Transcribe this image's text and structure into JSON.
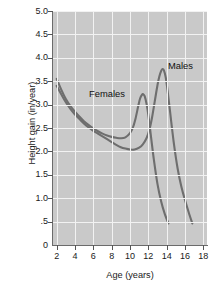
{
  "chart_data": {
    "type": "line",
    "title": "",
    "xlabel": "Age (years)",
    "ylabel": "Height gain (in/year)",
    "xlim": [
      1.6,
      18.4
    ],
    "ylim": [
      0,
      5.0
    ],
    "grid": true,
    "legend_position": "inline-annotation",
    "xticks": [
      "2",
      "4",
      "6",
      "8",
      "10",
      "12",
      "14",
      "16",
      "18"
    ],
    "xtick_values": [
      2,
      4,
      6,
      8,
      10,
      12,
      14,
      16,
      18
    ],
    "yticks": [
      "0",
      ".5",
      "1.0",
      "1.5",
      "2.0",
      "2.5",
      "3.0",
      "3.5",
      "4.0",
      "4.5",
      "5.0"
    ],
    "ytick_values": [
      0,
      0.5,
      1.0,
      1.5,
      2.0,
      2.5,
      3.0,
      3.5,
      4.0,
      4.5,
      5.0
    ],
    "series": [
      {
        "name": "Females",
        "color": "#6e6e6e",
        "x": [
          2.0,
          2.5,
          3.0,
          3.5,
          4.0,
          4.5,
          5.0,
          5.5,
          6.0,
          6.5,
          7.0,
          7.5,
          8.0,
          8.5,
          9.0,
          9.5,
          10.0,
          10.3,
          10.6,
          10.9,
          11.1,
          11.3,
          11.45,
          11.6,
          11.8,
          12.0,
          12.3,
          12.6,
          13.0,
          13.4,
          13.8,
          14.2
        ],
        "values": [
          3.55,
          3.32,
          3.12,
          2.97,
          2.85,
          2.74,
          2.64,
          2.56,
          2.49,
          2.43,
          2.38,
          2.34,
          2.31,
          2.29,
          2.28,
          2.3,
          2.39,
          2.5,
          2.7,
          2.97,
          3.13,
          3.21,
          3.22,
          3.18,
          3.02,
          2.78,
          2.3,
          1.83,
          1.3,
          0.93,
          0.66,
          0.46
        ]
      },
      {
        "name": "Males",
        "color": "#6e6e6e",
        "x": [
          2.0,
          2.5,
          3.0,
          3.5,
          4.0,
          4.5,
          5.0,
          5.5,
          6.0,
          6.5,
          7.0,
          7.5,
          8.0,
          8.5,
          9.0,
          9.5,
          10.0,
          10.5,
          11.0,
          11.4,
          11.8,
          12.1,
          12.4,
          12.7,
          13.0,
          13.2,
          13.4,
          13.55,
          13.7,
          13.9,
          14.1,
          14.4,
          14.8,
          15.2,
          15.6,
          16.0,
          16.4,
          16.8
        ],
        "values": [
          3.4,
          3.22,
          3.05,
          2.91,
          2.79,
          2.69,
          2.59,
          2.51,
          2.44,
          2.38,
          2.32,
          2.26,
          2.2,
          2.14,
          2.09,
          2.06,
          2.04,
          2.04,
          2.08,
          2.15,
          2.28,
          2.45,
          2.72,
          3.07,
          3.42,
          3.6,
          3.72,
          3.76,
          3.73,
          3.58,
          3.3,
          2.8,
          2.15,
          1.63,
          1.25,
          0.96,
          0.7,
          0.46
        ]
      }
    ],
    "annotations": [
      {
        "text": "Females",
        "x": 9.3,
        "y": 3.34
      },
      {
        "text": "Males",
        "x": 15.6,
        "y": 3.93
      }
    ]
  },
  "style": {
    "plot_background": "#c9c9c9",
    "grid_color": "#f2f2f2",
    "axis_color": "#6b6b6b",
    "text_color": "#1a1a1a",
    "curve_color": "#6e6e6e",
    "page_background": "#ffffff"
  }
}
